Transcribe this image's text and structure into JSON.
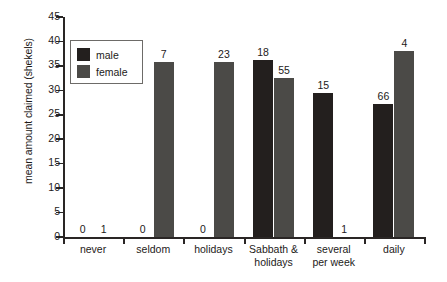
{
  "chart_data": {
    "type": "bar",
    "title": "",
    "xlabel": "",
    "ylabel": "mean amount claimed (shekels)",
    "ylim": [
      0,
      45
    ],
    "yticks": [
      0,
      5,
      10,
      15,
      20,
      25,
      30,
      35,
      40,
      45
    ],
    "grid": false,
    "legend_position": "upper-left-inside",
    "categories": [
      "never",
      "seldom",
      "holidays",
      "Sabbath & holidays",
      "several per week",
      "daily"
    ],
    "series": [
      {
        "name": "male",
        "color": "#231f1e",
        "values": [
          0,
          0,
          0,
          36.2,
          29.5,
          27.3
        ],
        "point_labels": [
          "0",
          "0",
          "0",
          "18",
          "15",
          "66"
        ]
      },
      {
        "name": "female",
        "color": "#4b4a47",
        "values": [
          0,
          35.7,
          35.7,
          32.5,
          0,
          38.0
        ],
        "point_labels": [
          "1",
          "7",
          "23",
          "55",
          "1",
          "4"
        ]
      }
    ]
  },
  "legend": {
    "entries": [
      {
        "label": "male",
        "color": "#231f1e"
      },
      {
        "label": "female",
        "color": "#4b4a47"
      }
    ]
  },
  "category_label_lines": [
    [
      "never"
    ],
    [
      "seldom"
    ],
    [
      "holidays"
    ],
    [
      "Sabbath &",
      "holidays"
    ],
    [
      "several",
      "per week"
    ],
    [
      "daily"
    ]
  ],
  "ytick_labels": [
    "0",
    "5",
    "10",
    "15",
    "20",
    "25",
    "30",
    "35",
    "40",
    "45"
  ]
}
